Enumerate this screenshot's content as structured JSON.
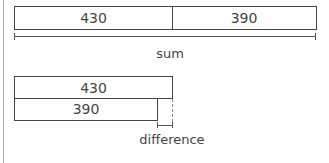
{
  "sum_diagram": {
    "parts": [
      {
        "value": "430"
      },
      {
        "value": "390"
      }
    ],
    "label": "sum"
  },
  "difference_diagram": {
    "bars": [
      {
        "value": "430"
      },
      {
        "value": "390"
      }
    ],
    "label": "difference"
  }
}
